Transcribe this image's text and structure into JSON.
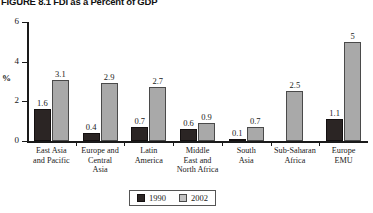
{
  "figure": {
    "title": "FIGURE 8.1   FDI as a Percent of GDP"
  },
  "chart_data": {
    "type": "bar",
    "title": "FIGURE 8.1   FDI as a Percent of GDP",
    "xlabel": "",
    "ylabel": "%",
    "ylim": [
      0,
      6
    ],
    "yticks": [
      0,
      2,
      4,
      6
    ],
    "ytick_labels": [
      "0",
      "2",
      "4",
      "6"
    ],
    "grid": false,
    "legend_position": "bottom-center",
    "categories": [
      "East Asia and Pacific",
      "Europe and Central Asia",
      "Latin America",
      "Middle East and North Africa",
      "South Asia",
      "Sub-Saharan Africa",
      "Europe EMU"
    ],
    "series": [
      {
        "name": "1990",
        "color": "#2b2524",
        "values": [
          1.6,
          0.4,
          0.7,
          0.6,
          0.1,
          null,
          1.1
        ],
        "value_labels": [
          "1.6",
          "0.4",
          "0.7",
          "0.6",
          "0.1",
          "",
          "1.1"
        ]
      },
      {
        "name": "2002",
        "color": "#a9a9a9",
        "values": [
          3.1,
          2.9,
          2.7,
          0.9,
          0.7,
          2.5,
          5
        ],
        "value_labels": [
          "3.1",
          "2.9",
          "2.7",
          "0.9",
          "0.7",
          "2.5",
          "5"
        ]
      }
    ]
  },
  "axis": {
    "y_title": "%",
    "ticks": [
      {
        "label": "6"
      },
      {
        "label": "4"
      },
      {
        "label": "2"
      },
      {
        "label": "0"
      }
    ]
  },
  "categories_display": [
    {
      "lines": [
        "East Asia",
        "and Pacific"
      ]
    },
    {
      "lines": [
        "Europe and",
        "Central",
        "Asia"
      ]
    },
    {
      "lines": [
        "Latin",
        "America"
      ]
    },
    {
      "lines": [
        "Middle",
        "East and",
        "North Africa"
      ]
    },
    {
      "lines": [
        "South",
        "Asia"
      ]
    },
    {
      "lines": [
        "Sub-Saharan",
        "Africa"
      ]
    },
    {
      "lines": [
        "Europe",
        "EMU"
      ]
    }
  ],
  "legend": {
    "entries": [
      {
        "label": "1990",
        "swatch": "dark-swatch-icon"
      },
      {
        "label": "2002",
        "swatch": "light-swatch-icon"
      }
    ]
  }
}
